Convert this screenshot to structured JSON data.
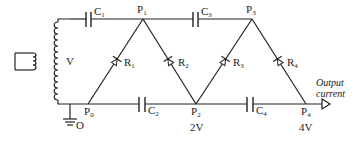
{
  "diagram": {
    "type": "Cockcroft-Walton voltage multiplier",
    "source_label": "V",
    "ground_label": "O",
    "capacitors": [
      {
        "id": "C1",
        "label": "C",
        "sub": "1"
      },
      {
        "id": "C2",
        "label": "C",
        "sub": "2"
      },
      {
        "id": "C3",
        "label": "C",
        "sub": "3"
      },
      {
        "id": "C4",
        "label": "C",
        "sub": "4"
      }
    ],
    "rectifiers": [
      {
        "id": "R1",
        "label": "R",
        "sub": "1"
      },
      {
        "id": "R2",
        "label": "R",
        "sub": "2"
      },
      {
        "id": "R3",
        "label": "R",
        "sub": "3"
      },
      {
        "id": "R4",
        "label": "R",
        "sub": "4"
      }
    ],
    "points": [
      {
        "id": "P0",
        "label": "P",
        "sub": "0"
      },
      {
        "id": "P1",
        "label": "P",
        "sub": "1"
      },
      {
        "id": "P2",
        "label": "P",
        "sub": "2"
      },
      {
        "id": "P3",
        "label": "P",
        "sub": "3"
      },
      {
        "id": "P4",
        "label": "P",
        "sub": "4"
      }
    ],
    "voltages": {
      "P2": "2V",
      "P4": "4V"
    },
    "output": {
      "line1": "Output",
      "line2": "current"
    }
  }
}
